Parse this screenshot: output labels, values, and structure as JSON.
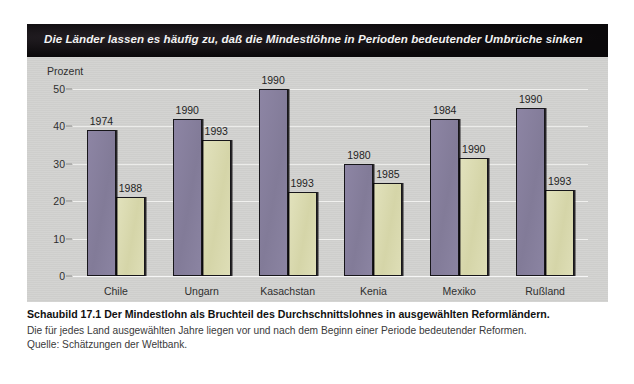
{
  "figure": {
    "banner_title": "Die Länder lassen es häufig zu, daß die Mindestlöhne in Perioden bedeutender Umbrüche sinken",
    "caption_heading": "Schaubild 17.1   Der Mindestlohn als Bruchteil des Durchschnittslohnes in ausgewählten Reformländern.",
    "caption_note": "Die für jedes Land ausgewählten Jahre liegen vor und nach dem Beginn einer Periode bedeutender Reformen.",
    "caption_source": "Quelle: Schätzungen der Weltbank."
  },
  "colors": {
    "banner_bg": "#100d10",
    "panel_bg": "#d2d2d0",
    "bar_first": "#888099",
    "bar_second": "#dcdcb2",
    "bar_outline": "#17161a",
    "gridline": "#f0f0ee"
  },
  "chart_data": {
    "type": "bar",
    "title": "Die Länder lassen es häufig zu, daß die Mindestlöhne in Perioden bedeutender Umbrüche sinken",
    "xlabel": "",
    "ylabel": "Prozent",
    "ylim": [
      0,
      50
    ],
    "yticks": [
      0,
      10,
      20,
      30,
      40,
      50
    ],
    "ytick_labels": [
      "0",
      "10",
      "20",
      "30",
      "40",
      "50"
    ],
    "grid": true,
    "legend": "none",
    "categories": [
      "Chile",
      "Ungarn",
      "Kasachstan",
      "Kenia",
      "Mexiko",
      "Rußland"
    ],
    "series": [
      {
        "name": "vor der Reform",
        "point_labels": [
          "1974",
          "1990",
          "1990",
          "1980",
          "1984",
          "1990"
        ],
        "values": [
          39,
          42,
          50,
          30,
          42,
          45
        ]
      },
      {
        "name": "nach der Reform",
        "point_labels": [
          "1988",
          "1993",
          "1993",
          "1985",
          "1990",
          "1993"
        ],
        "values": [
          21,
          36.5,
          22.5,
          25,
          31.5,
          23
        ]
      }
    ]
  }
}
